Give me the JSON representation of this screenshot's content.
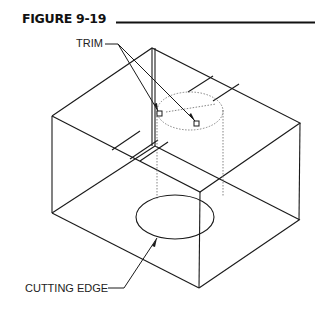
{
  "figure": {
    "title": "FIGURE 9-19"
  },
  "labels": {
    "trim": "TRIM",
    "cutting_edge": "CUTTING  EDGE"
  },
  "colors": {
    "line": "#1a1a1a",
    "dotted": "#777777",
    "background": "#ffffff"
  }
}
